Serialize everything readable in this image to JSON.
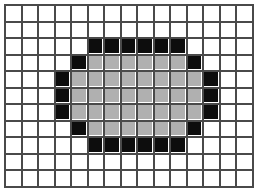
{
  "figure": {
    "grid": {
      "columns": 15,
      "rows": 11,
      "cell_size_px": 16.5,
      "origin_x_px": 4,
      "origin_y_px": 4
    },
    "colors": {
      "background": "#ffffff",
      "gridline": "#4a4a4a",
      "outline_fill": "#0d0d0d",
      "interior_fill": "#b0b0b0",
      "empty_fill": "#ffffff"
    },
    "legend": {
      "black_label": "outline pixel",
      "gray_label": "interior pixel",
      "white_label": "empty pixel"
    },
    "counts": {
      "black_cells": 24,
      "gray_cells": 44,
      "empty_cells": 97,
      "total_cells": 165
    },
    "cells": [
      [
        "e",
        "e",
        "e",
        "e",
        "e",
        "e",
        "e",
        "e",
        "e",
        "e",
        "e",
        "e",
        "e",
        "e",
        "e"
      ],
      [
        "e",
        "e",
        "e",
        "e",
        "e",
        "e",
        "e",
        "e",
        "e",
        "e",
        "e",
        "e",
        "e",
        "e",
        "e"
      ],
      [
        "e",
        "e",
        "e",
        "e",
        "e",
        "b",
        "b",
        "b",
        "b",
        "b",
        "b",
        "e",
        "e",
        "e",
        "e"
      ],
      [
        "e",
        "e",
        "e",
        "e",
        "b",
        "g",
        "g",
        "g",
        "g",
        "g",
        "g",
        "b",
        "e",
        "e",
        "e"
      ],
      [
        "e",
        "e",
        "e",
        "b",
        "g",
        "g",
        "g",
        "g",
        "g",
        "g",
        "g",
        "g",
        "b",
        "e",
        "e"
      ],
      [
        "e",
        "e",
        "e",
        "b",
        "g",
        "g",
        "g",
        "g",
        "g",
        "g",
        "g",
        "g",
        "b",
        "e",
        "e"
      ],
      [
        "e",
        "e",
        "e",
        "b",
        "g",
        "g",
        "g",
        "g",
        "g",
        "g",
        "g",
        "g",
        "b",
        "e",
        "e"
      ],
      [
        "e",
        "e",
        "e",
        "e",
        "b",
        "g",
        "g",
        "g",
        "g",
        "g",
        "g",
        "b",
        "e",
        "e",
        "e"
      ],
      [
        "e",
        "e",
        "e",
        "e",
        "e",
        "b",
        "b",
        "b",
        "b",
        "b",
        "b",
        "e",
        "e",
        "e",
        "e"
      ],
      [
        "e",
        "e",
        "e",
        "e",
        "e",
        "e",
        "e",
        "e",
        "e",
        "e",
        "e",
        "e",
        "e",
        "e",
        "e"
      ],
      [
        "e",
        "e",
        "e",
        "e",
        "e",
        "e",
        "e",
        "e",
        "e",
        "e",
        "e",
        "e",
        "e",
        "e",
        "e"
      ]
    ]
  }
}
